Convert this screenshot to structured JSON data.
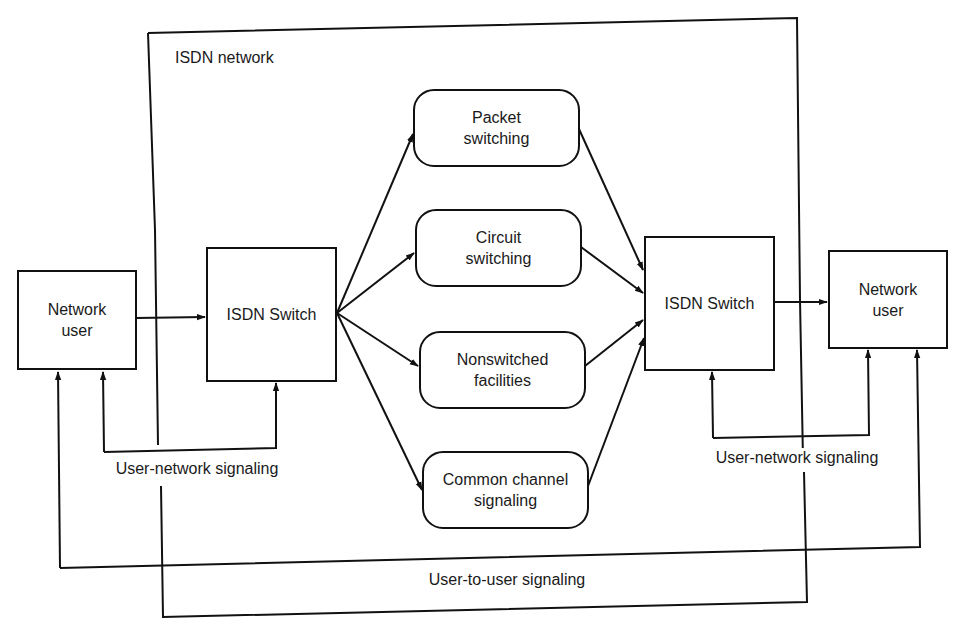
{
  "diagram": {
    "title": "ISDN network",
    "left_user": {
      "label": "Network\nuser"
    },
    "right_user": {
      "label": "Network\nuser"
    },
    "left_switch": {
      "label": "ISDN Switch"
    },
    "right_switch": {
      "label": "ISDN Switch"
    },
    "facilities": [
      {
        "label": "Packet\nswitching"
      },
      {
        "label": "Circuit\nswitching"
      },
      {
        "label": "Nonswitched\nfacilities"
      },
      {
        "label": "Common channel\nsignaling"
      }
    ],
    "signals": {
      "left_user_network": "User-network signaling",
      "right_user_network": "User-network signaling",
      "user_to_user": "User-to-user signaling"
    },
    "colors": {
      "line": "#111111",
      "background": "#ffffff",
      "text": "#1a1a1a"
    }
  }
}
